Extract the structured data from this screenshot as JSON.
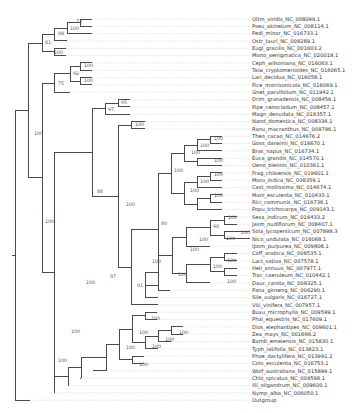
{
  "figure": {
    "type": "phylogenetic-tree",
    "leaves": [
      "Oltm_viridis_NC_008099.1",
      "Pseu_akinetum_NC_008114.1",
      "Pedi_minor_NC_016733.1",
      "Ostr_tauri_NC_008289.1",
      "Eugl_gracilis_NC_001603.2",
      "Mono_aenigmatica_NC_020018.1",
      "Ceph_wilsoniana_NC_016063.1",
      "Taiw_cryptomerioides_NC_016065.1",
      "Lari_decidua_NC_016058.1",
      "Pice_morrisonicola_NC_016069.1",
      "Gnet_parvifolium_NC_011942.1",
      "Drim_granadensis_NC_008456.1",
      "Pipe_cenocladum_NC_008457.1",
      "Magn_denudata_NC_018357.1",
      "Nand_domestica_NC_008336.1",
      "Ranu_macranthus_NC_008796.1",
      "Theo_cacao_NC_014676.2",
      "Goss_darwinii_NC_016670.1",
      "Bras_napus_NC_016734.1",
      "Euca_grandis_NC_014570.1",
      "Oeno_biennis_NC_010361.1",
      "Frag_chiloensis_NC_019601.1",
      "Moru_indica_NC_008359.1",
      "Cast_mollissima_NC_014674.1",
      "Mani_esculenta_NC_010433.1",
      "Rici_communis_NC_016736.1",
      "Popu_trichocarpa_NC_009143.1",
      "Sesa_indicum_NC_016433.2",
      "Jasm_nudiflorum_NC_008407.1",
      "Sola_lycopersicum_NC_007898.3",
      "Nico_undulata_NC_016068.1",
      "Ipom_purpurea_NC_009808.1",
      "Coff_arabica_NC_008535.1",
      "Lact_sativa_NC_007578.1",
      "Heli_annuus_NC_007977.1",
      "Trac_caeruleum_NC_010442.1",
      "Dauc_carota_NC_008325.1",
      "Pana_ginseng_NC_006290.1",
      "Sile_vulgaris_NC_016727.1",
      "Viti_vinifera_NC_007957.1",
      "Buxu_microphylla_NC_009599.1",
      "Phal_equestris_NC_017609.1",
      "Dios_elephantipes_NC_009601.1",
      "Zea_mays_NC_001666.2",
      "Bamb_emeiensis_NC_015830.1",
      "Typh_latifolia_NC_013823.1",
      "Phoe_dactylifera_NC_013991.2",
      "Colo_esculenta_NC_016753.1",
      "Wolf_australiana_NC_015899.1",
      "Chlo_spicatus_NC_009598.1",
      "Illi_oligandrum_NC_009600.1",
      "Nymp_alba_NC_006050.1",
      "Outgroup"
    ],
    "support_values": [
      {
        "x": 76,
        "y": 23,
        "v": "73"
      },
      {
        "x": 70,
        "y": 30,
        "v": "100"
      },
      {
        "x": 58,
        "y": 35,
        "v": "84"
      },
      {
        "x": 45,
        "y": 44,
        "v": "81"
      },
      {
        "x": 54,
        "y": 54,
        "v": "100"
      },
      {
        "x": 84,
        "y": 67,
        "v": "100"
      },
      {
        "x": 73,
        "y": 75,
        "v": "92"
      },
      {
        "x": 84,
        "y": 82,
        "v": "100"
      },
      {
        "x": 58,
        "y": 85,
        "v": "75"
      },
      {
        "x": 121,
        "y": 104,
        "v": "95"
      },
      {
        "x": 108,
        "y": 111,
        "v": "97"
      },
      {
        "x": 135,
        "y": 126,
        "v": "100"
      },
      {
        "x": 34,
        "y": 135,
        "v": "100"
      },
      {
        "x": 214,
        "y": 140,
        "v": "100"
      },
      {
        "x": 200,
        "y": 147,
        "v": "100"
      },
      {
        "x": 214,
        "y": 162,
        "v": "100"
      },
      {
        "x": 191,
        "y": 154,
        "v": "100"
      },
      {
        "x": 174,
        "y": 172,
        "v": "100"
      },
      {
        "x": 214,
        "y": 176,
        "v": "100"
      },
      {
        "x": 200,
        "y": 183,
        "v": "100"
      },
      {
        "x": 214,
        "y": 197,
        "v": "100"
      },
      {
        "x": 190,
        "y": 192,
        "v": "100"
      },
      {
        "x": 97,
        "y": 193,
        "v": "88"
      },
      {
        "x": 126,
        "y": 206,
        "v": "100"
      },
      {
        "x": 161,
        "y": 225,
        "v": "80"
      },
      {
        "x": 45,
        "y": 223,
        "v": "100"
      },
      {
        "x": 228,
        "y": 219,
        "v": "100"
      },
      {
        "x": 213,
        "y": 228,
        "v": "98"
      },
      {
        "x": 241,
        "y": 234,
        "v": "100"
      },
      {
        "x": 226,
        "y": 240,
        "v": "100"
      },
      {
        "x": 199,
        "y": 241,
        "v": "100"
      },
      {
        "x": 190,
        "y": 251,
        "v": "100"
      },
      {
        "x": 152,
        "y": 263,
        "v": "100"
      },
      {
        "x": 227,
        "y": 262,
        "v": "100"
      },
      {
        "x": 213,
        "y": 268,
        "v": "100"
      },
      {
        "x": 227,
        "y": 283,
        "v": "100"
      },
      {
        "x": 178,
        "y": 276,
        "v": "100"
      },
      {
        "x": 110,
        "y": 278,
        "v": "97"
      },
      {
        "x": 137,
        "y": 287,
        "v": "91"
      },
      {
        "x": 86,
        "y": 284,
        "v": "100"
      },
      {
        "x": 151,
        "y": 320,
        "v": "100"
      },
      {
        "x": 179,
        "y": 334,
        "v": "100"
      },
      {
        "x": 165,
        "y": 341,
        "v": "100"
      },
      {
        "x": 139,
        "y": 334,
        "v": "100"
      },
      {
        "x": 152,
        "y": 348,
        "v": "100"
      },
      {
        "x": 126,
        "y": 349,
        "v": "100"
      },
      {
        "x": 139,
        "y": 366,
        "v": "100"
      },
      {
        "x": 71,
        "y": 333,
        "v": "100"
      },
      {
        "x": 58,
        "y": 362,
        "v": "100"
      }
    ]
  }
}
